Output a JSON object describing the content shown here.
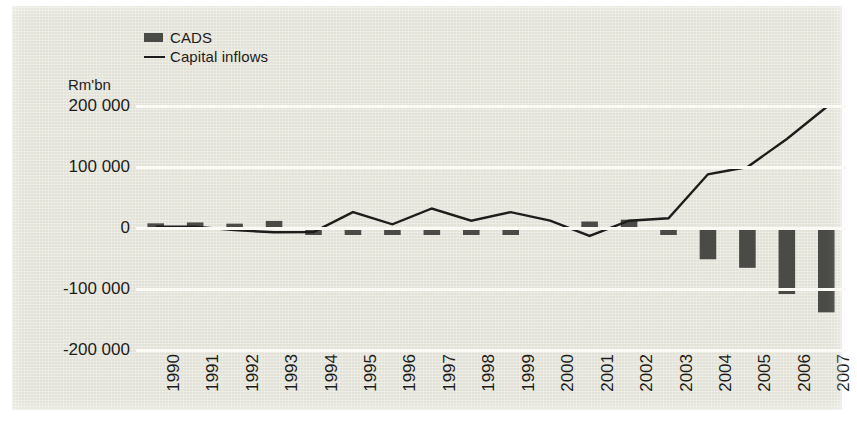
{
  "chart_data": {
    "type": "bar",
    "title": "",
    "subtitle": "",
    "xlabel": "",
    "ylabel": "Rm'bn",
    "unit_caption": "Rm'bn",
    "categories": [
      "1990",
      "1991",
      "1992",
      "1993",
      "1994",
      "1995",
      "1996",
      "1997",
      "1998",
      "1999",
      "2000",
      "2001",
      "2002",
      "2003",
      "2004",
      "2005",
      "2006",
      "2007"
    ],
    "ylim": [
      -200000,
      200000
    ],
    "yticks": [
      200000,
      100000,
      0,
      -100000,
      -200000
    ],
    "ytick_labels": [
      "200 000",
      "100 000",
      "0",
      "-100 000",
      "-200 000"
    ],
    "grid": true,
    "grid_color": "#fbfaf4",
    "legend_position": "top-left",
    "background_color": "#e3e2d8",
    "series": [
      {
        "name": "CADS",
        "type": "bar",
        "color": "#4a4a46",
        "values": [
          6000,
          7500,
          5500,
          10000,
          -4000,
          -4500,
          -5500,
          -6500,
          -6000,
          -2000,
          0,
          9000,
          12000,
          -5500,
          -48000,
          -62000,
          -105000,
          -135000
        ]
      },
      {
        "name": "Capital inflows",
        "type": "line",
        "color": "#1d1d1b",
        "values": [
          2000,
          2000,
          -3500,
          -7000,
          -6500,
          26000,
          6000,
          32000,
          12000,
          26000,
          12000,
          -13000,
          12000,
          16000,
          88000,
          100000,
          146000,
          198000
        ]
      }
    ],
    "legend": [
      {
        "label": "CADS",
        "marker": "bar-swatch",
        "color": "#4a4a46"
      },
      {
        "label": "Capital inflows",
        "marker": "line-swatch",
        "color": "#1d1d1b"
      }
    ]
  }
}
